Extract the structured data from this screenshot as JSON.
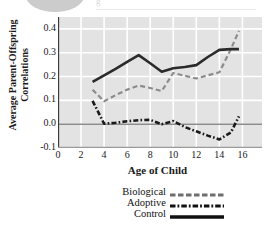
{
  "chart_data": {
    "type": "line",
    "title": "",
    "xlabel": "Age of Child",
    "ylabel_line1": "Average Parent-Offspring",
    "ylabel_line2": "Correlations",
    "xlim": [
      0,
      17.7
    ],
    "ylim": [
      -0.1,
      0.45
    ],
    "xticks": [
      0,
      2,
      4,
      6,
      8,
      10,
      12,
      14,
      16
    ],
    "yticks": [
      0.4,
      0.3,
      0.2,
      0.1,
      0.0,
      -0.1
    ],
    "ytick_labels": [
      "0.4",
      "0.3",
      "0.2",
      "0.1",
      "0.0",
      "-0.1"
    ],
    "xtick_labels": [
      "0",
      "2",
      "4",
      "6",
      "8",
      "10",
      "12",
      "14",
      "16"
    ],
    "grid": true,
    "grid_color": "#ffffff",
    "plot_background": "#e3e3e3",
    "zero_line": true,
    "legend_position": "below",
    "series": [
      {
        "name": "Biological",
        "style": "dashed",
        "color": "#8c8c8c",
        "x": [
          3,
          4,
          5,
          6,
          7,
          8,
          9,
          10,
          11,
          12,
          13,
          14,
          15,
          15.7
        ],
        "values": [
          0.145,
          0.096,
          0.122,
          0.145,
          0.162,
          0.152,
          0.139,
          0.215,
          0.203,
          0.192,
          0.205,
          0.218,
          0.315,
          0.392
        ]
      },
      {
        "name": "Adoptive",
        "style": "dash-dot",
        "color": "#1a1a1a",
        "x": [
          3,
          4,
          5,
          6,
          7,
          8,
          9,
          10,
          11,
          12,
          13,
          14,
          15,
          15.7
        ],
        "values": [
          0.098,
          0.002,
          0.006,
          0.012,
          0.017,
          0.018,
          0.0,
          0.013,
          -0.012,
          -0.03,
          -0.048,
          -0.064,
          -0.035,
          0.033
        ]
      },
      {
        "name": "Control",
        "style": "solid",
        "color": "#2b2b2b",
        "x": [
          3,
          4,
          5,
          6,
          7,
          8,
          9,
          10,
          11,
          12,
          13,
          14,
          15,
          15.7
        ],
        "values": [
          0.178,
          0.205,
          0.232,
          0.262,
          0.29,
          0.256,
          0.22,
          0.235,
          0.24,
          0.248,
          0.282,
          0.312,
          0.315,
          0.315
        ]
      }
    ]
  },
  "legend": {
    "items": [
      {
        "label": "Biological",
        "style": "dashed"
      },
      {
        "label": "Adoptive",
        "style": "dash-dot"
      },
      {
        "label": "Control",
        "style": "solid"
      }
    ]
  },
  "artifact": {
    "text": "g"
  }
}
